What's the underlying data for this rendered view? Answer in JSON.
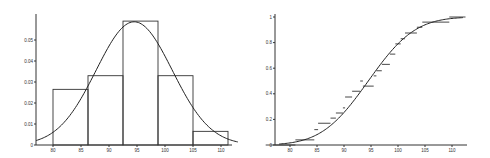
{
  "chart_data": [
    {
      "type": "bar",
      "subtype": "histogram-with-density",
      "title": "",
      "xlabel": "",
      "ylabel": "",
      "x_ticks": [
        80,
        85,
        90,
        95,
        100,
        105,
        110
      ],
      "y_ticks": [
        0,
        0.01,
        0.02,
        0.03,
        0.04,
        0.05
      ],
      "y_tick_labels": [
        "0",
        "0.01",
        "0.02",
        "0.03",
        "0.04",
        "0.05"
      ],
      "xlim": [
        77,
        113
      ],
      "ylim": [
        0,
        0.06
      ],
      "bins": [
        {
          "from": 80,
          "to": 86.25,
          "density": 0.0265
        },
        {
          "from": 86.25,
          "to": 92.5,
          "density": 0.033
        },
        {
          "from": 92.5,
          "to": 98.75,
          "density": 0.059
        },
        {
          "from": 98.75,
          "to": 105,
          "density": 0.033
        },
        {
          "from": 105,
          "to": 111.25,
          "density": 0.0065
        }
      ],
      "categories": [
        "80-86.25",
        "86.25-92.5",
        "92.5-98.75",
        "98.75-105",
        "105-111.25"
      ],
      "values": [
        0.0265,
        0.033,
        0.059,
        0.033,
        0.0065
      ],
      "overlay": {
        "type": "normal-density",
        "mean": 94.5,
        "sd": 6.8
      },
      "grid": false,
      "legend": null
    },
    {
      "type": "line",
      "subtype": "empirical-cdf-with-normal-cdf",
      "title": "",
      "xlabel": "",
      "ylabel": "",
      "x_ticks": [
        80,
        85,
        90,
        95,
        100,
        105,
        110
      ],
      "y_ticks": [
        0,
        0.2,
        0.4,
        0.6,
        0.8,
        1
      ],
      "y_tick_labels": [
        "0",
        "0.2",
        "0.4",
        "0.6",
        "0.8",
        "1"
      ],
      "xlim": [
        75,
        113
      ],
      "ylim": [
        0,
        1
      ],
      "steps": [
        {
          "x_from": 75.5,
          "x_to": 81,
          "y": 0.0
        },
        {
          "x_from": 81,
          "x_to": 84.5,
          "y": 0.04
        },
        {
          "x_from": 84.5,
          "x_to": 85.2,
          "y": 0.12
        },
        {
          "x_from": 85.2,
          "x_to": 87.5,
          "y": 0.17
        },
        {
          "x_from": 87.5,
          "x_to": 88.5,
          "y": 0.21
        },
        {
          "x_from": 88.5,
          "x_to": 89.8,
          "y": 0.25
        },
        {
          "x_from": 89.8,
          "x_to": 90.2,
          "y": 0.29
        },
        {
          "x_from": 90.2,
          "x_to": 91.5,
          "y": 0.375
        },
        {
          "x_from": 91.5,
          "x_to": 93.0,
          "y": 0.42
        },
        {
          "x_from": 93.0,
          "x_to": 93.5,
          "y": 0.5
        },
        {
          "x_from": 93.5,
          "x_to": 95.5,
          "y": 0.46
        },
        {
          "x_from": 95.5,
          "x_to": 96.0,
          "y": 0.54
        },
        {
          "x_from": 96.0,
          "x_to": 97.0,
          "y": 0.58
        },
        {
          "x_from": 97.0,
          "x_to": 98.5,
          "y": 0.63
        },
        {
          "x_from": 98.5,
          "x_to": 99.5,
          "y": 0.71
        },
        {
          "x_from": 99.5,
          "x_to": 100.5,
          "y": 0.79
        },
        {
          "x_from": 100.5,
          "x_to": 101.3,
          "y": 0.83
        },
        {
          "x_from": 101.3,
          "x_to": 103.5,
          "y": 0.875
        },
        {
          "x_from": 103.5,
          "x_to": 104.5,
          "y": 0.92
        },
        {
          "x_from": 104.5,
          "x_to": 109.5,
          "y": 0.96
        },
        {
          "x_from": 109.5,
          "x_to": 112.5,
          "y": 1.0
        }
      ],
      "overlay": {
        "type": "normal-cdf",
        "mean": 94.5,
        "sd": 6.8
      },
      "grid": false,
      "legend": null
    }
  ]
}
